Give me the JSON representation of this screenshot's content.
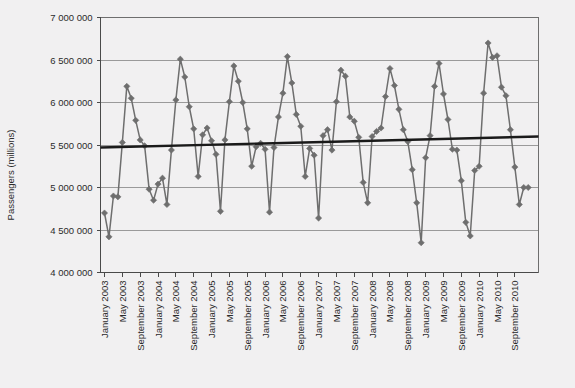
{
  "chart_data": {
    "type": "line",
    "title": "",
    "xlabel": "",
    "ylabel": "Passengers (millions)",
    "ylim": [
      4000000,
      7000000
    ],
    "ytick_values": [
      4000000,
      4500000,
      5000000,
      5500000,
      6000000,
      6500000,
      7000000
    ],
    "ytick_labels": [
      "4 000 000",
      "4 500 000",
      "5 000 000",
      "5 500 000",
      "6 000 000",
      "6 500 000",
      "7 000 000"
    ],
    "grid": true,
    "legend": "none",
    "marker": "diamond",
    "series_color": "#6e6e6e",
    "trend_color": "#1a1a1a",
    "plot_bg": "#f1f0f1",
    "xtick_labels": [
      "January 2003",
      "May 2003",
      "September 2003",
      "January 2004",
      "May 2004",
      "September 2004",
      "January 2005",
      "May 2005",
      "September 2005",
      "January 2006",
      "May 2006",
      "September 2006",
      "January 2007",
      "May 2007",
      "September 2007",
      "January 2008",
      "May 2008",
      "September 2008",
      "January 2009",
      "May 2009",
      "September 2009",
      "January 2010",
      "May 2010",
      "September 2010"
    ],
    "xtick_interval_months": 4,
    "x_start": "January 2003",
    "x_end": "December 2010",
    "series": [
      {
        "name": "Passengers",
        "values": [
          4700000,
          4420000,
          4900000,
          4890000,
          5530000,
          6190000,
          6050000,
          5790000,
          5560000,
          5490000,
          4980000,
          4850000,
          5040000,
          5110000,
          4800000,
          5440000,
          6030000,
          6510000,
          6300000,
          5950000,
          5690000,
          5130000,
          5620000,
          5700000,
          5550000,
          5390000,
          4720000,
          5560000,
          6010000,
          6430000,
          6250000,
          6000000,
          5690000,
          5250000,
          5480000,
          5520000,
          5450000,
          4710000,
          5470000,
          5830000,
          6110000,
          6540000,
          6230000,
          5860000,
          5720000,
          5130000,
          5460000,
          5380000,
          4640000,
          5610000,
          5680000,
          5440000,
          6010000,
          6380000,
          6310000,
          5830000,
          5780000,
          5590000,
          5060000,
          4820000,
          5600000,
          5660000,
          5700000,
          6070000,
          6400000,
          6200000,
          5920000,
          5680000,
          5540000,
          5210000,
          4820000,
          4350000,
          5350000,
          5610000,
          6190000,
          6460000,
          6100000,
          5800000,
          5450000,
          5440000,
          5080000,
          4590000,
          4430000,
          5200000,
          5250000,
          6110000,
          6700000,
          6530000,
          6550000,
          6180000,
          6080000,
          5680000,
          5240000,
          4800000,
          5000000,
          5000000
        ]
      }
    ],
    "trendline": {
      "name": "Linear trend",
      "start_value": 5470000,
      "end_value": 5600000
    }
  }
}
